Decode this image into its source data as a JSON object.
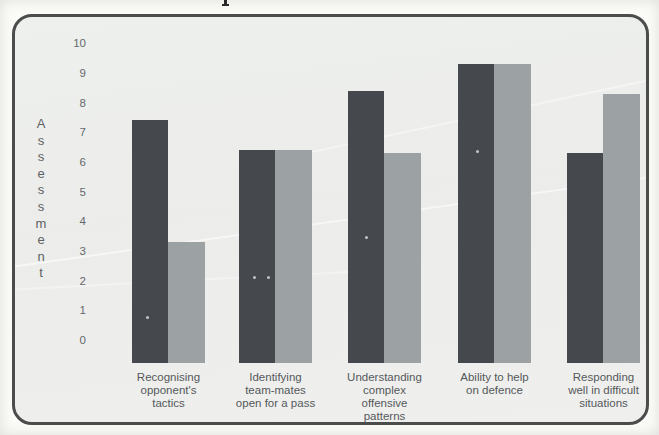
{
  "chart_data": {
    "type": "bar",
    "title": "",
    "xlabel": "",
    "ylabel": "Assessment",
    "ylim": [
      0,
      10
    ],
    "yticks": [
      "10",
      "9",
      "8",
      "7",
      "6",
      "5",
      "4",
      "3",
      "2",
      "1",
      "0"
    ],
    "grid": false,
    "legend_position": "none",
    "categories": [
      {
        "label": "Recognising opponent's tactics",
        "lines": [
          "Recognising",
          "opponent's",
          "tactics"
        ]
      },
      {
        "label": "Identifying team-mates open for a pass",
        "lines": [
          "Identifying",
          "team-mates",
          "open for a pass"
        ]
      },
      {
        "label": "Understanding complex offensive patterns",
        "lines": [
          "Understanding",
          "complex",
          "offensive",
          "patterns"
        ]
      },
      {
        "label": "Ability to help on defence",
        "lines": [
          "Ability to help",
          "on defence"
        ]
      },
      {
        "label": "Responding well in difficult situations",
        "lines": [
          "Responding",
          "well in difficult",
          "situations"
        ]
      }
    ],
    "series": [
      {
        "name": "series-1-dark-grey",
        "color": "#45494d",
        "values": [
          7.4,
          6.4,
          8.4,
          9.3,
          6.3
        ]
      },
      {
        "name": "series-2-light-grey",
        "color": "#9ca1a4",
        "values": [
          3.3,
          6.4,
          6.3,
          9.3,
          8.3
        ]
      }
    ]
  },
  "colors": {
    "frame_border": "#4b4d4d",
    "frame_background": "#edefec",
    "page_background": "#fbfbf8",
    "axis_text": "#64686b",
    "category_text": "#55585b"
  }
}
